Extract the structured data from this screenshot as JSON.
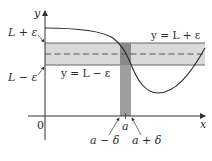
{
  "figure": {
    "axes": {
      "x_label": "x",
      "y_label": "y",
      "origin_label": "0"
    },
    "y_labels": {
      "upper": "L + ε",
      "lower": "L − ε"
    },
    "line_labels": {
      "upper": "y = L + ε",
      "lower": "y = L − ε"
    },
    "x_labels": {
      "center": "a",
      "left": "a − δ",
      "right": "a + δ"
    },
    "colors": {
      "band": "#d9d9d9",
      "strip": "#9e9e9e",
      "strip_in_band": "#8a8a8a",
      "curve": "#2b2b2b",
      "axis": "#333333",
      "band_edge": "#555555",
      "dashed": "#555555"
    }
  }
}
